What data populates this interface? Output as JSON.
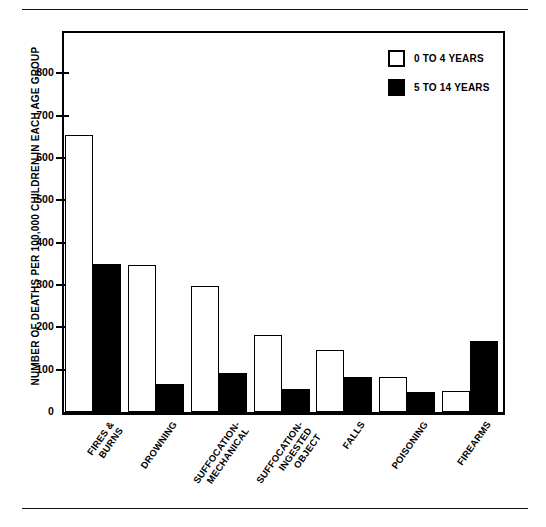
{
  "chart_data": {
    "type": "bar",
    "title": "",
    "xlabel": "",
    "ylabel": "NUMBER OF DEATHS PER 100,000 CHILDREN IN EACH AGE GROUP",
    "ylim": [
      0,
      900
    ],
    "ytick_values": [
      0,
      100,
      200,
      300,
      400,
      500,
      600,
      700,
      800
    ],
    "ytick_labels": [
      "0",
      "100",
      "200",
      "300",
      "400",
      "500",
      "600",
      "700",
      "800"
    ],
    "grid": false,
    "legend_position": "top-right",
    "categories": [
      "FIRES &\nBURNS",
      "DROWNING",
      "SUFFOCATION-\nMECHANICAL",
      "SUFFOCATION-\nINGESTED\nOBJECT",
      "FALLS",
      "POISONING",
      "FIREARMS"
    ],
    "series": [
      {
        "name": "0 TO 4 YEARS",
        "color": "#ffffff",
        "values": [
          655,
          348,
          298,
          182,
          147,
          83,
          50
        ]
      },
      {
        "name": "5 TO 14 YEARS",
        "color": "#000000",
        "values": [
          350,
          65,
          92,
          55,
          83,
          48,
          168
        ]
      }
    ]
  },
  "legend": {
    "items": [
      {
        "label": "0 TO 4 YEARS",
        "swatch": "hollow-square-icon"
      },
      {
        "label": "5 TO 14 YEARS",
        "swatch": "filled-square-icon"
      }
    ]
  }
}
